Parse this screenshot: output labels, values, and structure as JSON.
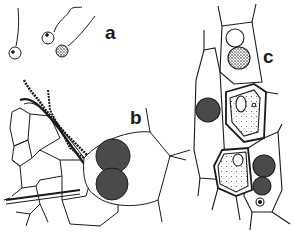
{
  "figure": {
    "type": "scientific line illustration",
    "panels": [
      {
        "id": "a",
        "label": "a",
        "content": "three uniflagellate zoospores"
      },
      {
        "id": "b",
        "label": "b",
        "content": "host tissue with germ tubes and two stippled sporangia"
      },
      {
        "id": "c",
        "label": "c",
        "content": "elongated host cells containing resting spores and infected cells"
      }
    ],
    "colors": {
      "ink": "#1a1a1a",
      "paper": "#ffffff",
      "stipple": "#333333"
    }
  }
}
